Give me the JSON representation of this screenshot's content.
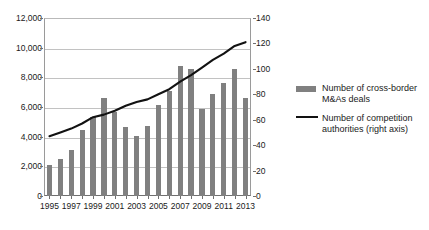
{
  "chart_data": {
    "type": "bar",
    "title": "",
    "subtitle": "",
    "xlabel": "",
    "ylabel": "",
    "grid": true,
    "legend_position": "right",
    "x": [
      1995,
      1996,
      1997,
      1998,
      1999,
      2000,
      2001,
      2002,
      2003,
      2004,
      2005,
      2006,
      2007,
      2008,
      2009,
      2010,
      2011,
      2012,
      2013
    ],
    "categories": [
      "1995",
      "1996",
      "1997",
      "1998",
      "1999",
      "2000",
      "2001",
      "2002",
      "2003",
      "2004",
      "2005",
      "2006",
      "2007",
      "2008",
      "2009",
      "2010",
      "2011",
      "2012",
      "2013"
    ],
    "xtick_labels": [
      "1995",
      "1997",
      "1999",
      "2001",
      "2003",
      "2005",
      "2007",
      "2009",
      "2011",
      "2013"
    ],
    "xtick_values": [
      1995,
      1997,
      1999,
      2001,
      2003,
      2005,
      2007,
      2009,
      2011,
      2013
    ],
    "ylim": [
      0,
      12000
    ],
    "ytick_values": [
      0,
      2000,
      4000,
      6000,
      8000,
      10000,
      12000
    ],
    "ytick_labels": [
      "0",
      "2,000",
      "4,000",
      "6,000",
      "8,000",
      "10,000",
      "12,000"
    ],
    "y2lim": [
      0,
      140
    ],
    "y2tick_values": [
      0,
      20,
      40,
      60,
      80,
      100,
      120,
      140
    ],
    "y2tick_labels": [
      "0",
      "20",
      "40",
      "60",
      "80",
      "100",
      "120",
      "140"
    ],
    "series": [
      {
        "name": "Number of cross-border M&As deals",
        "type": "bar",
        "axis": "left",
        "color": "#808080",
        "values": [
          2080,
          2480,
          3090,
          4450,
          5330,
          6640,
          5650,
          4630,
          4030,
          4710,
          6130,
          7050,
          8790,
          8560,
          5840,
          6910,
          7630,
          8550,
          6580
        ]
      },
      {
        "name": "Number of competition authorities (right axis)",
        "type": "line",
        "axis": "right",
        "color": "#121212",
        "values": [
          47,
          50,
          53,
          57,
          62,
          64,
          67,
          71,
          74,
          76,
          80,
          84,
          90,
          95,
          101,
          107,
          112,
          118,
          121
        ]
      }
    ]
  },
  "legend": {
    "entries": [
      {
        "label": "Number of cross-border M&As deals",
        "marker": "bar-swatch",
        "color": "#808080"
      },
      {
        "label": "Number of competition authorities (right axis)",
        "marker": "line-swatch",
        "color": "#121212"
      }
    ]
  }
}
